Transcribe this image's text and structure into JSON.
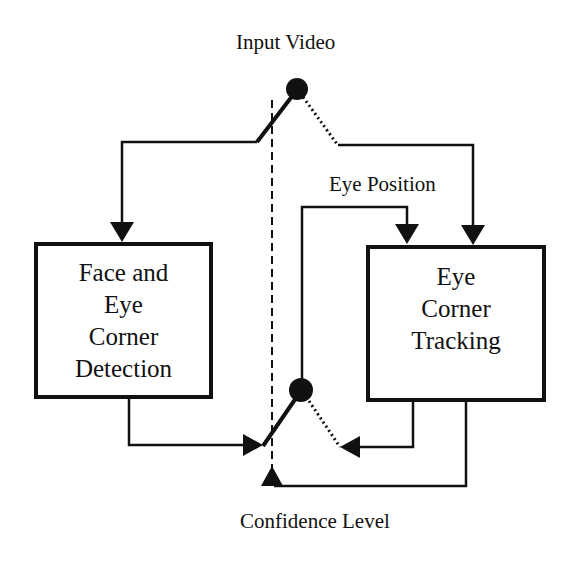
{
  "diagram": {
    "labels": {
      "input": "Input Video",
      "eye_position": "Eye Position",
      "confidence": "Confidence Level"
    },
    "nodes": [
      {
        "id": "detection",
        "label": "Face and\nEye\nCorner\nDetection"
      },
      {
        "id": "tracking",
        "label": "Eye\nCorner\nTracking"
      }
    ],
    "switches": [
      {
        "id": "input-switch",
        "active": "detection",
        "inactive": "tracking"
      },
      {
        "id": "output-switch",
        "active": "detection-output",
        "inactive": "tracking-output"
      }
    ],
    "edges": [
      {
        "from": "Input Video",
        "to": "Face and Eye Corner Detection",
        "style": "solid"
      },
      {
        "from": "Input Video",
        "to": "Eye Corner Tracking",
        "style": "dotted"
      },
      {
        "from": "Face and Eye Corner Detection",
        "to": "output-switch",
        "style": "solid"
      },
      {
        "from": "Eye Corner Tracking",
        "to": "output-switch",
        "style": "dotted"
      },
      {
        "from": "output-switch",
        "to": "Eye Corner Tracking",
        "label": "Eye Position"
      },
      {
        "from": "Eye Corner Tracking",
        "to": "switch-control",
        "label": "Confidence Level"
      }
    ],
    "colors": {
      "ink": "#111111",
      "background": "#ffffff"
    }
  }
}
